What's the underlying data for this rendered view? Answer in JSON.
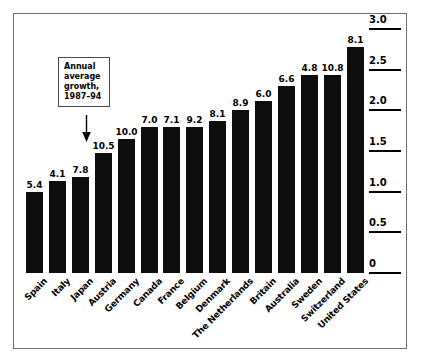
{
  "chart_data": {
    "type": "bar",
    "title": "",
    "subtitle": "",
    "xlabel": "",
    "ylabel": "",
    "ylim": [
      0,
      3.0
    ],
    "grid": false,
    "legend": "none",
    "axis_position": "right",
    "categories": [
      "Spain",
      "Italy",
      "Japan",
      "Austria",
      "Germany",
      "Canada",
      "France",
      "Belgium",
      "Denmark",
      "The Netherlands",
      "Britain",
      "Australia",
      "Sweden",
      "Switzerland",
      "United States"
    ],
    "values": [
      1.0,
      1.13,
      1.18,
      1.48,
      1.65,
      1.8,
      1.8,
      1.8,
      1.87,
      2.0,
      2.12,
      2.3,
      2.43,
      2.43,
      2.78
    ],
    "data_labels": [
      "5.4",
      "4.1",
      "7.8",
      "10.5",
      "10.0",
      "7.0",
      "7.1",
      "9.2",
      "8.1",
      "8.9",
      "6.0",
      "6.6",
      "4.8",
      "10.8",
      "8.1"
    ],
    "ytick_labels": [
      "0",
      "0.5",
      "1.0",
      "1.5",
      "2.0",
      "2.5",
      "3.0"
    ],
    "ytick_values": [
      0,
      0.5,
      1.0,
      1.5,
      2.0,
      2.5,
      3.0
    ],
    "bar_color": "#0d0d0d",
    "annotations": [
      {
        "name": "annual-average-growth-callout",
        "lines": [
          "Annual",
          "average",
          "growth,",
          "1987–94"
        ],
        "points_to": "Japan"
      }
    ]
  },
  "annotation": {
    "line1": "Annual",
    "line2": "average",
    "line3": "growth,",
    "line4": "1987–94"
  }
}
